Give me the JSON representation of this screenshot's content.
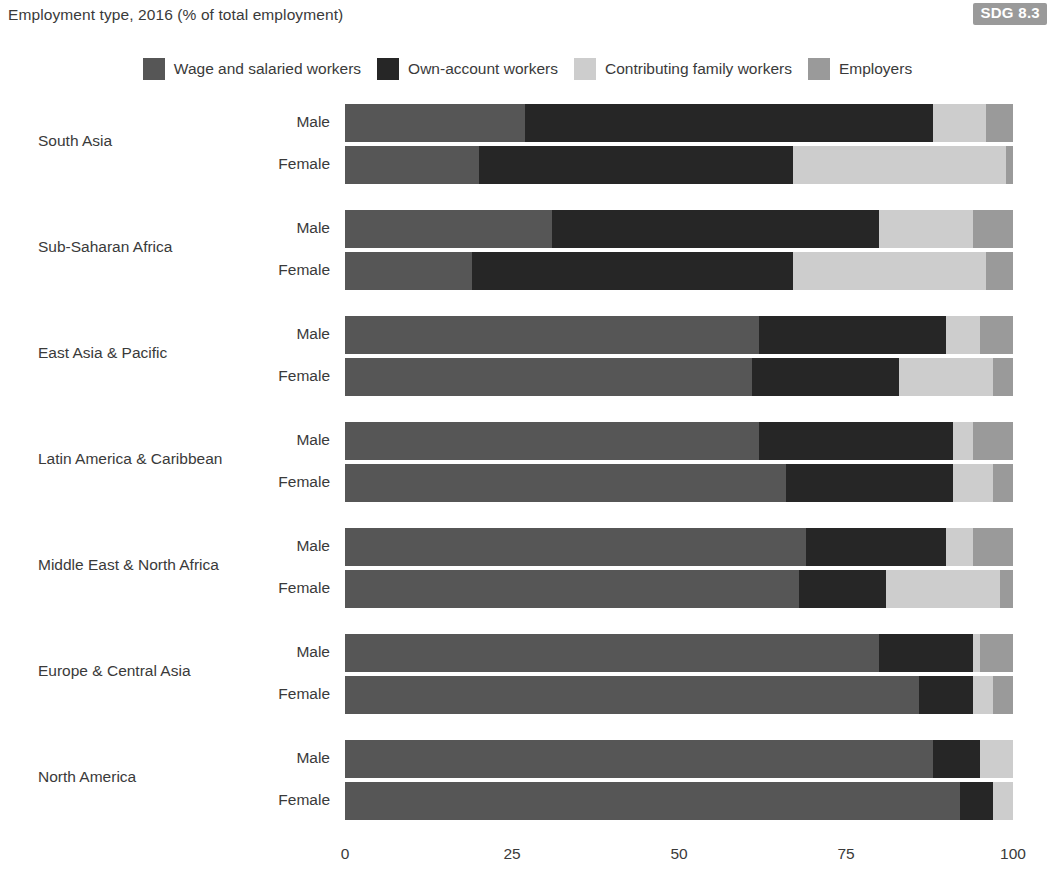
{
  "header": {
    "title": "Employment type, 2016 (% of total employment)",
    "badge": "SDG 8.3"
  },
  "legend": {
    "items": [
      {
        "label": "Wage and salaried workers",
        "color": "#565656",
        "key": "wage"
      },
      {
        "label": "Own-account workers",
        "color": "#262626",
        "key": "own"
      },
      {
        "label": "Contributing family workers",
        "color": "#cdcdcd",
        "key": "family"
      },
      {
        "label": "Employers",
        "color": "#9a9a9a",
        "key": "employers"
      }
    ]
  },
  "axis": {
    "ticks": [
      "0",
      "25",
      "50",
      "75",
      "100"
    ],
    "min": 0,
    "max": 100
  },
  "sex_labels": {
    "male": "Male",
    "female": "Female"
  },
  "chart_data": {
    "type": "bar",
    "orientation": "horizontal",
    "stacked": true,
    "normalized": true,
    "title": "Employment type, 2016 (% of total employment)",
    "xlabel": "",
    "ylabel": "",
    "xlim": [
      0,
      100
    ],
    "xticks": [
      0,
      25,
      50,
      75,
      100
    ],
    "grid": false,
    "legend_position": "top-center",
    "series_names": [
      "Wage and salaried workers",
      "Own-account workers",
      "Contributing family workers",
      "Employers"
    ],
    "series_colors": [
      "#565656",
      "#262626",
      "#cdcdcd",
      "#9a9a9a"
    ],
    "categories": [
      "South Asia",
      "Sub-Saharan Africa",
      "East Asia & Pacific",
      "Latin America & Caribbean",
      "Middle East & North Africa",
      "Europe & Central Asia",
      "North America"
    ],
    "groups": [
      {
        "region": "South Asia",
        "rows": [
          {
            "sex": "Male",
            "values": {
              "wage": 27,
              "own": 61,
              "family": 8,
              "employers": 4
            }
          },
          {
            "sex": "Female",
            "values": {
              "wage": 20,
              "own": 47,
              "family": 32,
              "employers": 1
            }
          }
        ]
      },
      {
        "region": "Sub-Saharan Africa",
        "rows": [
          {
            "sex": "Male",
            "values": {
              "wage": 31,
              "own": 49,
              "family": 14,
              "employers": 6
            }
          },
          {
            "sex": "Female",
            "values": {
              "wage": 19,
              "own": 48,
              "family": 29,
              "employers": 4
            }
          }
        ]
      },
      {
        "region": "East Asia & Pacific",
        "rows": [
          {
            "sex": "Male",
            "values": {
              "wage": 62,
              "own": 28,
              "family": 5,
              "employers": 5
            }
          },
          {
            "sex": "Female",
            "values": {
              "wage": 61,
              "own": 22,
              "family": 14,
              "employers": 3
            }
          }
        ]
      },
      {
        "region": "Latin America & Caribbean",
        "rows": [
          {
            "sex": "Male",
            "values": {
              "wage": 62,
              "own": 29,
              "family": 3,
              "employers": 6
            }
          },
          {
            "sex": "Female",
            "values": {
              "wage": 66,
              "own": 25,
              "family": 6,
              "employers": 3
            }
          }
        ]
      },
      {
        "region": "Middle East & North Africa",
        "rows": [
          {
            "sex": "Male",
            "values": {
              "wage": 69,
              "own": 21,
              "family": 4,
              "employers": 6
            }
          },
          {
            "sex": "Female",
            "values": {
              "wage": 68,
              "own": 13,
              "family": 17,
              "employers": 2
            }
          }
        ]
      },
      {
        "region": "Europe & Central Asia",
        "rows": [
          {
            "sex": "Male",
            "values": {
              "wage": 80,
              "own": 14,
              "family": 1,
              "employers": 5
            }
          },
          {
            "sex": "Female",
            "values": {
              "wage": 86,
              "own": 8,
              "family": 3,
              "employers": 3
            }
          }
        ]
      },
      {
        "region": "North America",
        "rows": [
          {
            "sex": "Male",
            "values": {
              "wage": 88,
              "own": 7,
              "family": 5,
              "employers": 0
            }
          },
          {
            "sex": "Female",
            "values": {
              "wage": 92,
              "own": 5,
              "family": 3,
              "employers": 0
            }
          }
        ]
      }
    ]
  }
}
